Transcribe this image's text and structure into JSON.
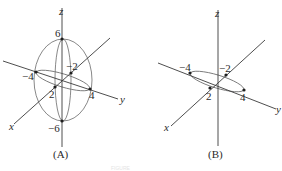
{
  "figure": {
    "panels": [
      {
        "id": "A",
        "caption": "(A)",
        "description": "Ellipsoid with semi-axes 2 (x), 4 (y), 6 (z)",
        "axes": {
          "x": "x",
          "y": "y",
          "z": "z"
        },
        "labels": {
          "z_pos": "6",
          "z_neg": "−6",
          "y_neg": "−4",
          "y_pos": "4",
          "x_neg": "−2",
          "x_pos": "2"
        }
      },
      {
        "id": "B",
        "caption": "(B)",
        "description": "Ellipse in xy-plane with semi-axes 2 (x), 4 (y)",
        "axes": {
          "x": "x",
          "y": "y",
          "z": "z"
        },
        "labels": {
          "y_neg": "−4",
          "y_pos": "4",
          "x_neg": "−2",
          "x_pos": "2"
        }
      }
    ],
    "footer_text": "FIGURE"
  }
}
